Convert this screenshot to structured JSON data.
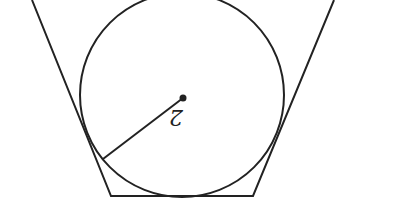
{
  "diagram": {
    "radius_label": "2",
    "colors": {
      "stroke": "#222222",
      "background": "#ffffff"
    },
    "shapes": {
      "circle": {
        "cx": 182,
        "cy": 95,
        "r": 102
      },
      "center_point": {
        "x": 183,
        "y": 98
      },
      "radius_endpoint": {
        "x": 103,
        "y": 159
      },
      "polygon": [
        [
          32,
          0
        ],
        [
          111,
          196
        ],
        [
          253,
          196
        ],
        [
          334,
          0
        ]
      ]
    }
  }
}
